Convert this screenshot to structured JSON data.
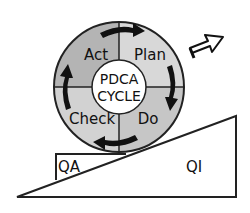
{
  "diagram": {
    "center": {
      "line1": "PDCA",
      "line2": "CYCLE"
    },
    "quadrants": [
      {
        "label": "Act",
        "position": "top-left"
      },
      {
        "label": "Plan",
        "position": "top-right"
      },
      {
        "label": "Check",
        "position": "bottom-left"
      },
      {
        "label": "Do",
        "position": "bottom-right"
      }
    ],
    "wedge": {
      "left_label": "QA",
      "right_label": "QI"
    },
    "icons": [
      "cycle-arrow-icon",
      "upward-arrow-icon"
    ],
    "colors": {
      "quadrant_left": "#b4b4b4",
      "quadrant_right": "#d2d2d2",
      "stroke": "#222222"
    }
  }
}
